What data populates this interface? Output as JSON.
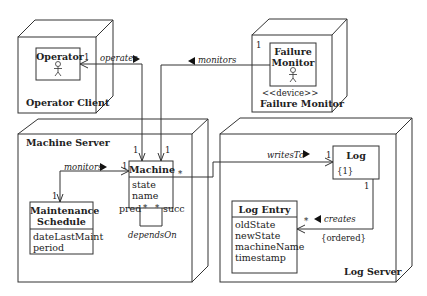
{
  "nodes": {
    "operator_client": {
      "label": "Operator Client",
      "component": {
        "name": "Operator",
        "multiplicity": "1"
      }
    },
    "failure_monitor_node": {
      "stereotype": "<<device>>",
      "label": "Failure Monitor",
      "multiplicity": "1",
      "component": {
        "name_line1": "Failure",
        "name_line2": "Monitor"
      }
    },
    "machine_server": {
      "label": "Machine Server",
      "machine": {
        "name": "Machine",
        "attributes": [
          "state",
          "name"
        ],
        "self_assoc": {
          "name": "dependsOn",
          "pred": "pred",
          "succ": "succ",
          "pred_mult": "*",
          "succ_mult": "*"
        }
      },
      "maintenance": {
        "name_line1": "Maintenance",
        "name_line2": "Schedule",
        "attributes": [
          "dateLastMaint",
          "period"
        ]
      }
    },
    "log_server": {
      "label": "Log Server",
      "log": {
        "name": "Log",
        "constraint": "{1}"
      },
      "log_entry": {
        "name": "Log Entry",
        "attributes": [
          "oldState",
          "newState",
          "machineName",
          "timestamp"
        ]
      }
    }
  },
  "associations": {
    "operates": {
      "label": "operates",
      "direction": "▶",
      "mult_operator": "1",
      "mult_machine": "1"
    },
    "monitors_failure": {
      "label": "monitors",
      "direction": "◀",
      "mult_machine": "1"
    },
    "monitors_maint": {
      "label": "monitors",
      "direction": "▶",
      "mult_machine": "1",
      "mult_maint": "1"
    },
    "writes_to": {
      "label": "writesTo",
      "direction": "▶",
      "mult_machine": "*",
      "mult_log": "1"
    },
    "creates": {
      "label": "creates",
      "direction": "◀",
      "mult_log": "1",
      "mult_entry": "*",
      "constraint": "{ordered}"
    }
  }
}
